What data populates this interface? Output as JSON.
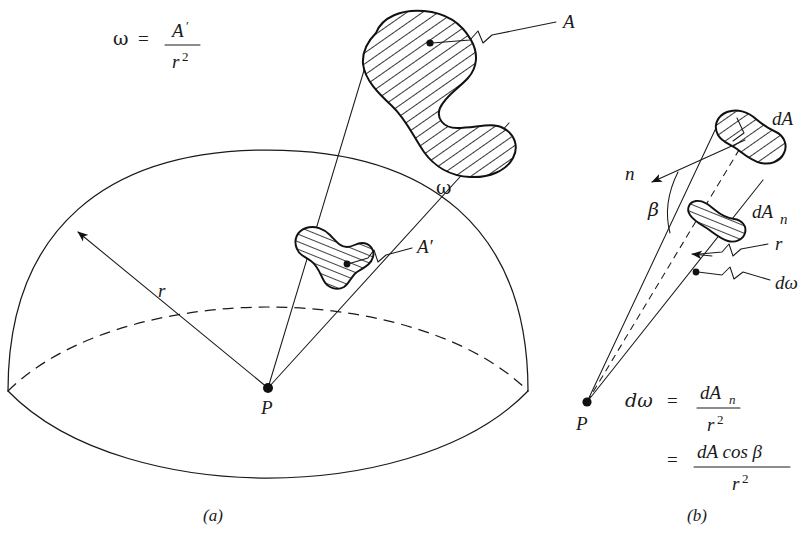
{
  "figure": {
    "title_omega_formula": {
      "symbol": "ω",
      "equals": "=",
      "numerator": "A",
      "numerator_prime": "′",
      "denominator": "r",
      "denominator_exponent": "2"
    },
    "panels": [
      {
        "id": "a",
        "caption": "(a)",
        "labels": {
          "area_A": "A",
          "area_A_prime": "A′",
          "radius": "r",
          "point": "P",
          "solid_angle": "ω"
        }
      },
      {
        "id": "b",
        "caption": "(b)",
        "labels": {
          "area_dA": "dA",
          "area_dAn": "dA",
          "area_dAn_sub": "n",
          "normal": "n",
          "angle": "β",
          "radius": "r",
          "solid_angle": "dω",
          "point": "P"
        },
        "equations": [
          {
            "lhs": "dω",
            "equals": "=",
            "numerator": "dA",
            "numerator_sub": "n",
            "denominator": "r",
            "denominator_exponent": "2"
          },
          {
            "lhs": "",
            "equals": "=",
            "numerator": "dA cos β",
            "numerator_sub": "",
            "denominator": "r",
            "denominator_exponent": "2"
          }
        ]
      }
    ],
    "colors": {
      "ink": "#1a1a1a",
      "background": "#ffffff",
      "hatch": "#111111"
    }
  }
}
